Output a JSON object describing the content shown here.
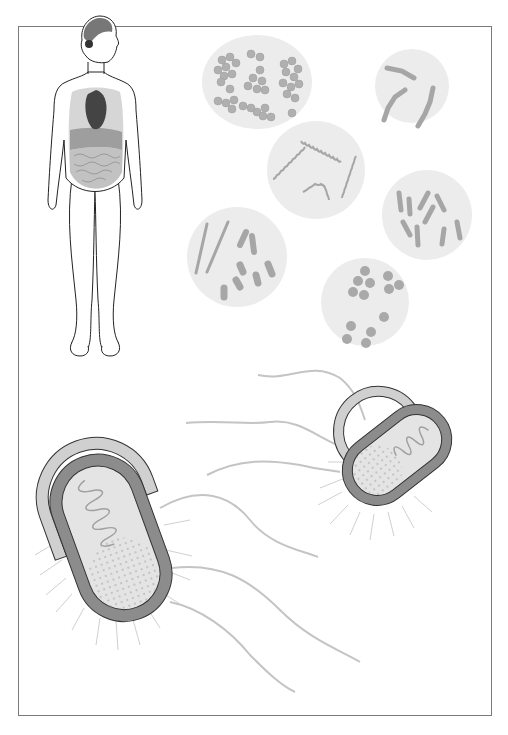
{
  "figure": {
    "colors": {
      "frame_border": "#7a7a7a",
      "circle_fill": "#ececec",
      "bacteria_fill": "#a6a6a6",
      "cell_wall_outer": "#d0d0d0",
      "cell_membrane": "#8c8c8c",
      "cytoplasm": "#e4e4e4",
      "flagella": "#c4c4c4",
      "outline": "#333333"
    },
    "panels": [
      {
        "id": "human-body",
        "label": "Human body with visible organs (brain, heart, lungs, liver, intestines)"
      },
      {
        "id": "cocci-clusters",
        "label": "Cocci clusters"
      },
      {
        "id": "streptobacilli",
        "label": "Chain-forming rods"
      },
      {
        "id": "spirochetes",
        "label": "Spiral bacteria"
      },
      {
        "id": "bacilli",
        "label": "Rod-shaped bacteria"
      },
      {
        "id": "mixed-rods",
        "label": "Long rods and coccobacilli"
      },
      {
        "id": "diplococci",
        "label": "Paired cocci"
      },
      {
        "id": "bacterium-large",
        "label": "Bacterial cell with capsule, DNA and flagella"
      },
      {
        "id": "bacterium-small",
        "label": "Bacterial cell with capsule, DNA and flagella"
      }
    ]
  }
}
